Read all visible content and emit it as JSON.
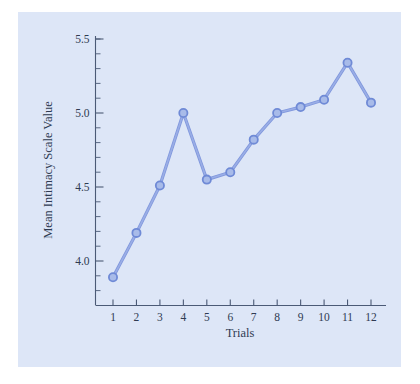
{
  "chart_data": {
    "type": "line",
    "title": "",
    "xlabel": "Trials",
    "ylabel": "Mean Intimacy Scale Value",
    "categories": [
      "1",
      "2",
      "3",
      "4",
      "5",
      "6",
      "7",
      "8",
      "9",
      "10",
      "11",
      "12"
    ],
    "x": [
      1,
      2,
      3,
      4,
      5,
      6,
      7,
      8,
      9,
      10,
      11,
      12
    ],
    "values": [
      3.89,
      4.19,
      4.51,
      5.0,
      4.55,
      4.6,
      4.82,
      5.0,
      5.04,
      5.09,
      5.34,
      5.07
    ],
    "series": [
      {
        "name": "Mean Intimacy Scale Value",
        "values": [
          3.89,
          4.19,
          4.51,
          5.0,
          4.55,
          4.6,
          4.82,
          5.0,
          5.04,
          5.09,
          5.34,
          5.07
        ],
        "color": "#8097dd"
      }
    ],
    "ylim": [
      3.75,
      5.62
    ],
    "xlim": [
      0.45,
      12.55
    ],
    "y_ticks_major": [
      4.0,
      4.5,
      5.0,
      5.5
    ],
    "y_tick_labels": [
      "4.0",
      "4.5",
      "5.0",
      "5.5"
    ],
    "y_ticks_minor": [
      3.8,
      3.9,
      4.1,
      4.2,
      4.3,
      4.4,
      4.6,
      4.7,
      4.8,
      4.9,
      5.1,
      5.2,
      5.3,
      5.4,
      5.5
    ],
    "x_ticks": [
      1,
      2,
      3,
      4,
      5,
      6,
      7,
      8,
      9,
      10,
      11,
      12
    ],
    "grid": false,
    "legend": false,
    "marker": "circle",
    "panel_color": "#dde6f7",
    "axis_color": "#4b5a76",
    "text_color": "#2f3b52"
  }
}
